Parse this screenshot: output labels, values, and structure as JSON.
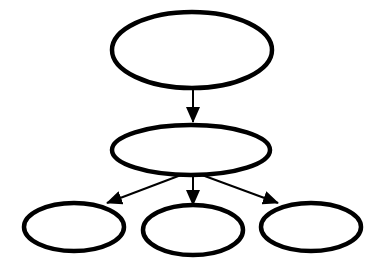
{
  "diagram": {
    "type": "hierarchy",
    "width": 388,
    "height": 277,
    "background": "#ffffff",
    "stroke_color": "#000000",
    "node_fill": "#ffffff",
    "node_stroke_width": 4.5,
    "edge_stroke_width": 2,
    "nodes": [
      {
        "id": "root",
        "label": "",
        "cx": 192,
        "cy": 50,
        "rx": 80,
        "ry": 38
      },
      {
        "id": "middle",
        "label": "",
        "cx": 191,
        "cy": 150,
        "rx": 79,
        "ry": 25
      },
      {
        "id": "child-left",
        "label": "",
        "cx": 74,
        "cy": 227,
        "rx": 50,
        "ry": 24
      },
      {
        "id": "child-center",
        "label": "",
        "cx": 193,
        "cy": 230,
        "rx": 50,
        "ry": 25
      },
      {
        "id": "child-right",
        "label": "",
        "cx": 311,
        "cy": 227,
        "rx": 50,
        "ry": 24
      }
    ],
    "edges": [
      {
        "from": "root",
        "to": "middle",
        "x1": 193,
        "y1": 88,
        "x2": 193,
        "y2": 122
      },
      {
        "from": "middle",
        "to": "child-left",
        "x1": 181,
        "y1": 175,
        "x2": 107,
        "y2": 203
      },
      {
        "from": "middle",
        "to": "child-center",
        "x1": 193,
        "y1": 175,
        "x2": 193,
        "y2": 205
      },
      {
        "from": "middle",
        "to": "child-right",
        "x1": 202,
        "y1": 175,
        "x2": 278,
        "y2": 203
      }
    ]
  }
}
